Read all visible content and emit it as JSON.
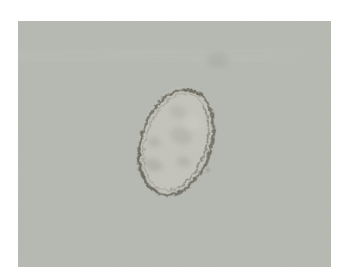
{
  "image": {
    "kind": "light microscope micrograph",
    "alt": "Micrograph of a single ovoid egg with a thick dark shell and granular internal contents, tilted with its long axis from lower left to upper right, on a uniform pale gray field"
  },
  "colors": {
    "page_background": "#ffffff",
    "field_background": "#b7b9b3",
    "egg_interior": "#c5c5bd",
    "egg_shell": "#6e6b5e",
    "egg_shell_dark": "#5c5a4c",
    "interior_mottle": "#8d8c80",
    "interior_highlight": "#d0d0c8",
    "artifact_streak": "#9fa19b",
    "artifact_smudge": "#9da09a",
    "debris_speck": "#8f8e85"
  }
}
